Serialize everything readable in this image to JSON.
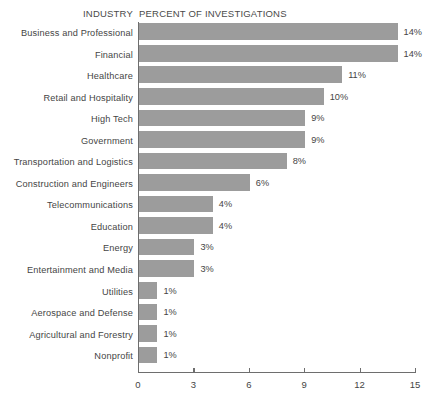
{
  "header": {
    "industry_label": "INDUSTRY",
    "percent_label": "PERCENT OF INVESTIGATIONS"
  },
  "colors": {
    "bar": "#9c9c9c",
    "axis": "#6e6e6e",
    "text": "#454545",
    "background": "#ffffff"
  },
  "chart_data": {
    "type": "bar",
    "orientation": "horizontal",
    "title": "PERCENT OF INVESTIGATIONS",
    "xlabel": "",
    "ylabel": "INDUSTRY",
    "xlim": [
      0,
      15
    ],
    "xticks": [
      0,
      3,
      6,
      9,
      12,
      15
    ],
    "xtick_labels": [
      "0",
      "3",
      "6",
      "9",
      "12",
      "15"
    ],
    "grid": false,
    "legend": false,
    "categories": [
      "Business and Professional",
      "Financial",
      "Healthcare",
      "Retail and Hospitality",
      "High Tech",
      "Government",
      "Transportation and Logistics",
      "Construction and Engineers",
      "Telecommunications",
      "Education",
      "Energy",
      "Entertainment and Media",
      "Utilities",
      "Aerospace and Defense",
      "Agricultural and Forestry",
      "Nonprofit"
    ],
    "values": [
      14,
      14,
      11,
      10,
      9,
      9,
      8,
      6,
      4,
      4,
      3,
      3,
      1,
      1,
      1,
      1
    ],
    "value_labels": [
      "14%",
      "14%",
      "11%",
      "10%",
      "9%",
      "9%",
      "8%",
      "6%",
      "4%",
      "4%",
      "3%",
      "3%",
      "1%",
      "1%",
      "1%",
      "1%"
    ]
  }
}
